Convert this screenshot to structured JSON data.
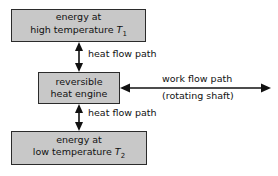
{
  "diagram": {
    "colors": {
      "box_fill": "#c8c8c8",
      "box_border": "#2b2b2b",
      "text": "#111111",
      "background": "#ffffff"
    },
    "boxes": {
      "high_temperature": {
        "line1": "energy at",
        "line2_prefix": "high temperature ",
        "symbol": "T",
        "subscript": "1"
      },
      "engine": {
        "line1": "reversible",
        "line2": "heat engine"
      },
      "low_temperature": {
        "line1": "energy at",
        "line2_prefix": "low temperature ",
        "symbol": "T",
        "subscript": "2"
      }
    },
    "labels": {
      "heat_flow_top": "heat flow path",
      "heat_flow_bottom": "heat flow path",
      "work_flow": "work flow path",
      "rotating_shaft": "(rotating shaft)"
    }
  }
}
